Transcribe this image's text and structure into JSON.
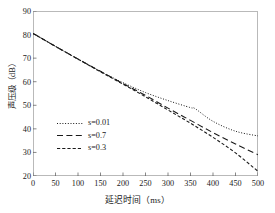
{
  "chart_data": {
    "type": "line",
    "title": "",
    "xlabel": "延迟时间（ms）",
    "ylabel": "声压级（dB）",
    "xlim": [
      0,
      500
    ],
    "ylim": [
      20,
      90
    ],
    "xticks": [
      "0",
      "50",
      "100",
      "150",
      "200",
      "250",
      "300",
      "350",
      "400",
      "450",
      "500"
    ],
    "yticks": [
      "20",
      "30",
      "40",
      "50",
      "60",
      "70",
      "80",
      "90"
    ],
    "grid": false,
    "legend_position": "lower-left-inside",
    "series": [
      {
        "name": "s=0.01",
        "style": "dotted",
        "color": "#1a1a1a",
        "x": [
          0,
          50,
          100,
          150,
          200,
          250,
          300,
          350,
          360,
          400,
          450,
          500
        ],
        "values": [
          80.5,
          75.0,
          69.6,
          64.4,
          59.6,
          55.4,
          52.0,
          49.0,
          48.6,
          43.2,
          39.0,
          37.0
        ]
      },
      {
        "name": "s=0.7",
        "style": "long-dashed",
        "color": "#1a1a1a",
        "x": [
          0,
          50,
          100,
          150,
          200,
          250,
          300,
          350,
          400,
          450,
          500
        ],
        "values": [
          80.5,
          75.0,
          69.6,
          64.4,
          59.2,
          54.2,
          48.8,
          43.6,
          38.4,
          33.6,
          29.0
        ]
      },
      {
        "name": "s=0.3",
        "style": "short-dashed",
        "color": "#1a1a1a",
        "x": [
          0,
          50,
          100,
          150,
          200,
          250,
          300,
          350,
          400,
          450,
          500
        ],
        "values": [
          80.5,
          75.0,
          69.6,
          64.2,
          59.0,
          53.6,
          48.0,
          42.4,
          36.4,
          29.8,
          22.0
        ]
      }
    ]
  },
  "legend": {
    "entries": [
      {
        "label": "s=0.01"
      },
      {
        "label": "s=0.7"
      },
      {
        "label": "s=0.3"
      }
    ]
  },
  "axes": {
    "x_title": "延迟时间（ms）",
    "y_title": "声压级（dB）"
  }
}
